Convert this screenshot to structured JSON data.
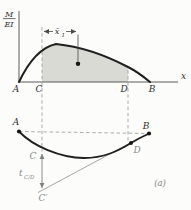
{
  "figure": {
    "caption": "(a)",
    "moment_diagram": {
      "ordinate_numerator": "M",
      "ordinate_denominator": "EI",
      "abscissa_label": "x",
      "point_a": "A",
      "point_c": "C",
      "point_d": "D",
      "point_b": "B",
      "centroid_distance_main": "x̄",
      "centroid_distance_sub": "1"
    },
    "elastic_curve": {
      "point_a": "A",
      "point_b": "B",
      "point_c": "C",
      "point_d": "D",
      "point_c_prime": "C′",
      "tangential_deviation_main": "t",
      "tangential_deviation_sub": "C/D"
    },
    "colors": {
      "curve_stroke": "#1f1f1f",
      "area_fill": "#d8dad3",
      "dashed_line": "#a0a5a2",
      "axis_line": "#4a4a4a",
      "tangent_line": "#9a9e9a",
      "deviation_arrow": "#7c8280",
      "gray_label": "#868c89",
      "dark_label": "#2f2f2f",
      "background": "#fcfcfa"
    }
  }
}
